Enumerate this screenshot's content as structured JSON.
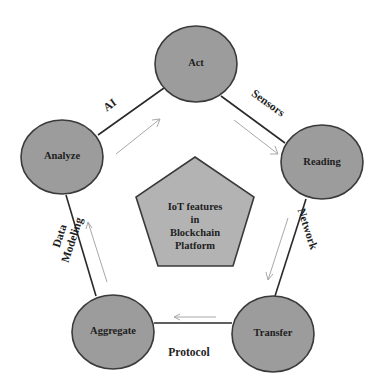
{
  "diagram": {
    "type": "cycle",
    "colors": {
      "node_fill": "#9c9c9c",
      "center_fill": "#b3b3b3",
      "stroke": "#3a3a3a",
      "flow_arrow": "#a8a8a8",
      "background": "#ffffff"
    },
    "center": {
      "shape": "pentagon",
      "lines": [
        "IoT features",
        "in",
        "Blockchain",
        "Platform"
      ]
    },
    "nodes": [
      {
        "id": "act",
        "label": "Act"
      },
      {
        "id": "reading",
        "label": "Reading"
      },
      {
        "id": "transfer",
        "label": "Transfer"
      },
      {
        "id": "aggregate",
        "label": "Aggregate"
      },
      {
        "id": "analyze",
        "label": "Analyze"
      }
    ],
    "edges": [
      {
        "from": "act",
        "to": "reading",
        "label": "Sensors"
      },
      {
        "from": "reading",
        "to": "transfer",
        "label": "Network"
      },
      {
        "from": "transfer",
        "to": "aggregate",
        "label": "Protocol"
      },
      {
        "from": "aggregate",
        "to": "analyze",
        "label_lines": [
          "Data",
          "Modeling"
        ]
      },
      {
        "from": "analyze",
        "to": "act",
        "label": "AI"
      }
    ],
    "flow_direction": "clockwise"
  }
}
